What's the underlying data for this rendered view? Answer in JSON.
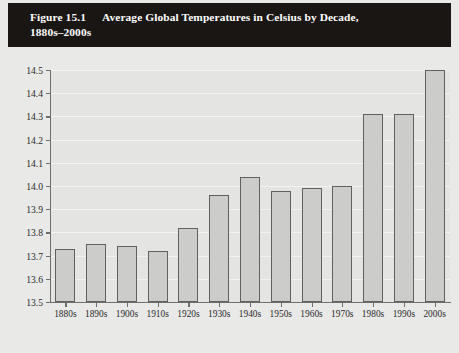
{
  "figure": {
    "number_label": "Figure 15.1",
    "title_line1": "Average Global Temperatures in Celsius by Decade,",
    "title_line2": "1880s–2000s",
    "banner_bg": "#1a1614",
    "banner_text_color": "#ffffff"
  },
  "style": {
    "page_bg": "#e9e9e7",
    "plot_bg": "#e4e5e3",
    "gridline_color": "#f2f3f1",
    "axis_color": "#6e6e6e",
    "bar_fill": "#cccdcb",
    "bar_stroke": "#5f6160",
    "tick_label_color": "#2a2a2a"
  },
  "chart_data": {
    "type": "bar",
    "title": "Average Global Temperatures in Celsius by Decade, 1880s–2000s",
    "xlabel": "",
    "ylabel": "",
    "categories": [
      "1880s",
      "1890s",
      "1900s",
      "1910s",
      "1920s",
      "1930s",
      "1940s",
      "1950s",
      "1960s",
      "1970s",
      "1980s",
      "1990s",
      "2000s"
    ],
    "values": [
      13.73,
      13.75,
      13.74,
      13.72,
      13.82,
      13.96,
      14.04,
      13.98,
      13.99,
      14.0,
      14.31,
      14.31,
      14.5
    ],
    "ylim": [
      13.5,
      14.5
    ],
    "yticks": [
      "13.5",
      "13.6",
      "13.7",
      "13.8",
      "13.9",
      "14.0",
      "14.1",
      "14.2",
      "14.3",
      "14.4",
      "14.5"
    ],
    "ytick_values": [
      13.5,
      13.6,
      13.7,
      13.8,
      13.9,
      14.0,
      14.1,
      14.2,
      14.3,
      14.4,
      14.5
    ],
    "grid": true,
    "legend": null,
    "legend_position": "none"
  }
}
